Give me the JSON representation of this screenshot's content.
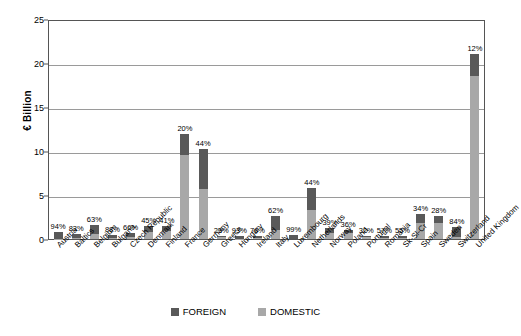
{
  "chart_data": {
    "type": "bar",
    "title": "",
    "xlabel": "",
    "ylabel": "€ Billion",
    "ylim": [
      0,
      25
    ],
    "yticks": [
      0,
      5,
      10,
      15,
      20,
      25
    ],
    "grid": true,
    "stacked": true,
    "legend_position": "bottom",
    "categories": [
      "Austria",
      "Baltics",
      "Belgium",
      "Bulgaria",
      "Czech Republic",
      "Denmark",
      "Finland",
      "France",
      "Germany",
      "Greece",
      "Hungary",
      "Ireland",
      "Italy",
      "Luxembourg",
      "Netherlands",
      "Norway",
      "Poland",
      "Portugal",
      "Romania",
      "Sk-Sl-Cr",
      "Spain",
      "Sweden",
      "Switzerland",
      "United Kingdom"
    ],
    "data_labels": [
      "94%",
      "83%",
      "63%",
      "88%",
      "66%",
      "45%",
      "41%",
      "20%",
      "44%",
      "23%",
      "93%",
      "76%",
      "62%",
      "99%",
      "44%",
      "39%",
      "36%",
      "32%",
      "57%",
      "55%",
      "34%",
      "28%",
      "84%",
      "12%"
    ],
    "totals": [
      0.8,
      0.6,
      1.6,
      0.5,
      0.7,
      1.5,
      1.5,
      11.9,
      10.2,
      0.3,
      0.3,
      0.4,
      2.6,
      0.5,
      5.8,
      1.2,
      1.0,
      0.3,
      0.3,
      0.3,
      2.8,
      2.6,
      1.4,
      21.0
    ],
    "series": [
      {
        "name": "FOREIGN",
        "color": "#595959",
        "values": [
          0.75,
          0.5,
          1.01,
          0.44,
          0.46,
          0.68,
          0.62,
          2.38,
          4.49,
          0.07,
          0.28,
          0.3,
          1.61,
          0.5,
          2.55,
          0.47,
          0.36,
          0.1,
          0.17,
          0.17,
          0.95,
          0.73,
          1.18,
          2.52
        ]
      },
      {
        "name": "DOMESTIC",
        "color": "#a8a8a8",
        "values": [
          0.05,
          0.1,
          0.59,
          0.06,
          0.24,
          0.82,
          0.88,
          9.52,
          5.71,
          0.23,
          0.02,
          0.1,
          0.99,
          0.0,
          3.25,
          0.73,
          0.64,
          0.2,
          0.13,
          0.13,
          1.85,
          1.87,
          0.22,
          18.48
        ]
      }
    ]
  },
  "legend": {
    "items": [
      {
        "label": "FOREIGN",
        "color": "#595959"
      },
      {
        "label": "DOMESTIC",
        "color": "#a8a8a8"
      }
    ]
  }
}
